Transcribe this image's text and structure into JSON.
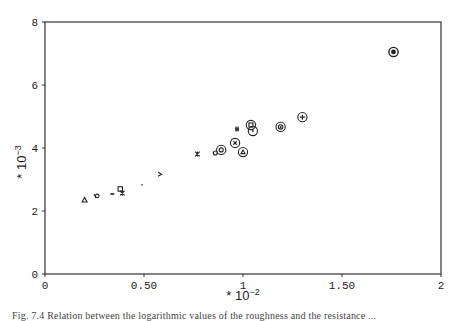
{
  "chart_data": {
    "type": "scatter",
    "title": "",
    "xlabel": "* 10^-2",
    "ylabel": "* 10^-3",
    "x_multiplier_label": {
      "base": "* 10",
      "exp": "−2"
    },
    "y_multiplier_label": {
      "base": "* 10",
      "exp": "−3"
    },
    "xlim": [
      0,
      2
    ],
    "ylim": [
      0,
      8
    ],
    "x_ticks": [
      0,
      0.5,
      1,
      1.5,
      2
    ],
    "x_tick_labels": [
      "0",
      "0.50",
      "1",
      "1.50",
      "2"
    ],
    "y_ticks": [
      0,
      2,
      4,
      6,
      8
    ],
    "y_tick_labels": [
      "0",
      "2",
      "4",
      "6",
      "8"
    ],
    "grid": false,
    "legend": null,
    "points": [
      {
        "x": 0.2,
        "y": 2.35,
        "marker": "triangle"
      },
      {
        "x": 0.26,
        "y": 2.48,
        "marker": "phi"
      },
      {
        "x": 0.34,
        "y": 2.54,
        "marker": "dash"
      },
      {
        "x": 0.38,
        "y": 2.7,
        "marker": "square"
      },
      {
        "x": 0.39,
        "y": 2.57,
        "marker": "star"
      },
      {
        "x": 0.49,
        "y": 2.83,
        "marker": "dot"
      },
      {
        "x": 0.58,
        "y": 3.17,
        "marker": "greater-than"
      },
      {
        "x": 0.77,
        "y": 3.81,
        "marker": "star"
      },
      {
        "x": 0.86,
        "y": 3.84,
        "marker": "small-circle"
      },
      {
        "x": 0.89,
        "y": 3.94,
        "marker": "circled-dot"
      },
      {
        "x": 0.96,
        "y": 4.16,
        "marker": "circled-x"
      },
      {
        "x": 0.97,
        "y": 4.6,
        "marker": "hash"
      },
      {
        "x": 1.0,
        "y": 3.87,
        "marker": "circled-triangle"
      },
      {
        "x": 1.04,
        "y": 4.73,
        "marker": "circled-square"
      },
      {
        "x": 1.05,
        "y": 4.54,
        "marker": "circled-dot-open"
      },
      {
        "x": 1.19,
        "y": 4.67,
        "marker": "circled-at"
      },
      {
        "x": 1.3,
        "y": 4.98,
        "marker": "circled-plus"
      },
      {
        "x": 1.76,
        "y": 7.05,
        "marker": "circled-dot-filled"
      }
    ]
  },
  "caption": "Fig. 7.4  Relation between the logarithmic values of the roughness and the resistance ..."
}
